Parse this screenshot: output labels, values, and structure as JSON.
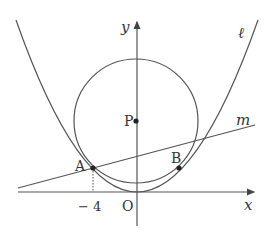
{
  "figure": {
    "colors": {
      "stroke": "#555555",
      "text": "#333333",
      "background": "#ffffff"
    },
    "labels": {
      "y_axis": "y",
      "x_axis": "x",
      "origin": "O",
      "parabola": "ℓ",
      "line": "m",
      "point_A": "A",
      "point_B": "B",
      "point_P": "P",
      "tick_A": "− 4"
    }
  }
}
